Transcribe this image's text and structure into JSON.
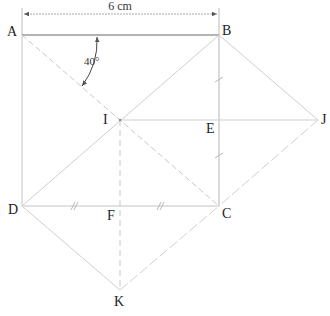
{
  "diagram": {
    "title": "",
    "points": {
      "A": {
        "label": "A",
        "x": 22,
        "y": 35
      },
      "B": {
        "label": "B",
        "x": 219,
        "y": 35
      },
      "C": {
        "label": "C",
        "x": 219,
        "y": 206
      },
      "D": {
        "label": "D",
        "x": 22,
        "y": 206
      },
      "I": {
        "label": "I",
        "x": 120,
        "y": 120
      },
      "E": {
        "label": "E",
        "x": 219,
        "y": 120
      },
      "J": {
        "label": "J",
        "x": 318,
        "y": 120
      },
      "F": {
        "label": "F",
        "x": 120,
        "y": 206
      },
      "K": {
        "label": "K",
        "x": 120,
        "y": 290
      }
    },
    "dimension": {
      "label": "6 cm",
      "from": "A",
      "to": "B"
    },
    "angle": {
      "label": "40°",
      "vertex": "A"
    },
    "colors": {
      "line": "#bdbdbd",
      "dark_line": "#9a9a9a",
      "text": "#222222"
    }
  }
}
